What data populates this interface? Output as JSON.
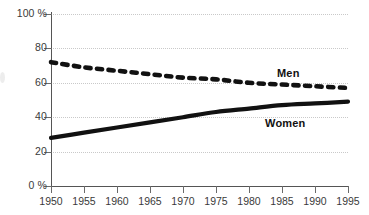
{
  "chart_data": {
    "type": "line",
    "title": "",
    "subtitle": "",
    "xlabel": "",
    "ylabel": "",
    "x": [
      1950,
      1955,
      1960,
      1965,
      1970,
      1975,
      1980,
      1985,
      1990,
      1995
    ],
    "xlim": [
      1950,
      1995
    ],
    "ylim": [
      0,
      100
    ],
    "grid": true,
    "legend_position": "inline-right",
    "y_ticks": [
      {
        "value": 100,
        "label": "100 %"
      },
      {
        "value": 80,
        "label": "80"
      },
      {
        "value": 60,
        "label": "60"
      },
      {
        "value": 40,
        "label": "40"
      },
      {
        "value": 20,
        "label": "20"
      },
      {
        "value": 0,
        "label": "0 %"
      }
    ],
    "x_ticks": [
      {
        "value": 1950,
        "label": "1950"
      },
      {
        "value": 1955,
        "label": "1955"
      },
      {
        "value": 1960,
        "label": "1960"
      },
      {
        "value": 1965,
        "label": "1965"
      },
      {
        "value": 1970,
        "label": "1970"
      },
      {
        "value": 1975,
        "label": "1975"
      },
      {
        "value": 1980,
        "label": "1980"
      },
      {
        "value": 1985,
        "label": "1985"
      },
      {
        "value": 1990,
        "label": "1990"
      },
      {
        "value": 1995,
        "label": "1995"
      }
    ],
    "series": [
      {
        "name": "Men",
        "label": "Men",
        "style": "dotted",
        "color": "#111111",
        "values": [
          72,
          69,
          67,
          65,
          63,
          62,
          60,
          59,
          58,
          57
        ]
      },
      {
        "name": "Women",
        "label": "Women",
        "style": "solid",
        "color": "#111111",
        "values": [
          28,
          31,
          34,
          37,
          40,
          43,
          45,
          47,
          48,
          49
        ]
      }
    ],
    "annotations": [
      {
        "text": "Men",
        "x": 1986,
        "y": 64
      },
      {
        "text": "Women",
        "x": 1983,
        "y": 44
      }
    ],
    "colors": {
      "series": "#111111",
      "gridline": "#c9c9c9",
      "axis": "#555555",
      "tick_label": "#3a3a3a",
      "background": "#ffffff"
    }
  }
}
